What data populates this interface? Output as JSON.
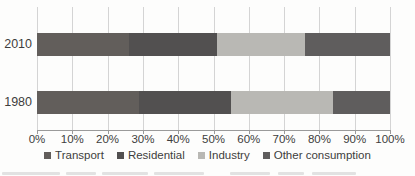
{
  "chart_data": {
    "type": "bar",
    "orientation": "horizontal",
    "stacked": true,
    "title": "",
    "xlabel": "",
    "ylabel": "",
    "categories": [
      "2010",
      "1980"
    ],
    "series": [
      {
        "name": "Transport",
        "values": [
          26,
          29
        ],
        "color": "#625e5b"
      },
      {
        "name": "Residential",
        "values": [
          25,
          26
        ],
        "color": "#525050"
      },
      {
        "name": "Industry",
        "values": [
          25,
          29
        ],
        "color": "#b9b8b4"
      },
      {
        "name": "Other consumption",
        "values": [
          24,
          16
        ],
        "color": "#5f5d5d"
      }
    ],
    "xlim": [
      0,
      100
    ],
    "x_ticks": [
      "0%",
      "10%",
      "20%",
      "30%",
      "40%",
      "50%",
      "60%",
      "70%",
      "80%",
      "90%",
      "100%"
    ],
    "grid": "vertical",
    "legend_position": "bottom"
  },
  "style_colors": {
    "gridline": "#d4d4d4",
    "axis": "#9a9a9a",
    "text": "#3d3d3d",
    "background": "#fdfdfc"
  },
  "caption_remnant_smudges": [
    {
      "left": 2,
      "width": 58
    },
    {
      "left": 66,
      "width": 30
    },
    {
      "left": 102,
      "width": 46
    },
    {
      "left": 154,
      "width": 50
    },
    {
      "left": 230,
      "width": 40
    },
    {
      "left": 278,
      "width": 26
    },
    {
      "left": 312,
      "width": 44
    }
  ]
}
